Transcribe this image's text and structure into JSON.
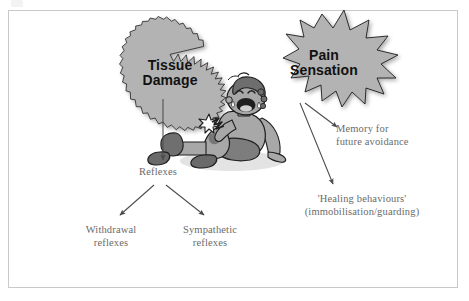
{
  "figure": {
    "background_color": "#ffffff",
    "frame_color": "#c9c9c9"
  },
  "bursts": [
    {
      "id": "tissue-damage",
      "label": "Tissue\nDamage",
      "line1": "Tissue",
      "line2": "Damage",
      "shape": "starburst-many-spikes",
      "fill": "#b3b3b3",
      "stroke": "#1a1a1a",
      "text_color": "#111111"
    },
    {
      "id": "pain-sensation",
      "label": "Pain\nSensation",
      "line1": "Pain",
      "line2": "Sensation",
      "shape": "starburst-few-spikes",
      "fill": "#b3b3b3",
      "stroke": "#1a1a1a",
      "text_color": "#111111"
    }
  ],
  "notes": {
    "reflexes": "Reflexes",
    "withdrawal": "Withdrawal\nreflexes",
    "withdrawal_line1": "Withdrawal",
    "withdrawal_line2": "reflexes",
    "sympathetic": "Sympathetic\nreflexes",
    "sympathetic_line1": "Sympathetic",
    "sympathetic_line2": "reflexes",
    "memory_line1": "Memory for",
    "memory_line2": "future avoidance",
    "healing_line1": "'Healing behaviours'",
    "healing_line2": "(immobilisation/guarding)",
    "text_color": "#6b6b6b"
  },
  "arrows": [
    {
      "id": "tissue-to-reflexes",
      "from": "tissue-damage",
      "to": "reflexes"
    },
    {
      "id": "reflexes-to-withdrawal",
      "from": "reflexes",
      "to": "withdrawal"
    },
    {
      "id": "reflexes-to-sympathetic",
      "from": "reflexes",
      "to": "sympathetic"
    },
    {
      "id": "pain-to-memory",
      "from": "pain-sensation",
      "to": "memory"
    },
    {
      "id": "pain-to-healing",
      "from": "pain-sensation",
      "to": "healing"
    }
  ],
  "illustration": {
    "id": "crying-child",
    "description": "Seated crying child with grazed knee",
    "skin": "#a8a8a8",
    "hair": "#6e6e6e",
    "shorts": "#7d7d7d",
    "sock": "#f0f0f0",
    "shoe": "#6a6a6a",
    "outline": "#1f1f1f",
    "pain_spark": "#ffffff"
  }
}
